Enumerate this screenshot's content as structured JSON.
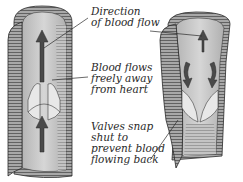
{
  "diagram": {
    "labels": {
      "direction": [
        "Direction",
        "of blood flow"
      ],
      "flows": [
        "Blood flows",
        "freely away",
        "from heart"
      ],
      "valves": [
        "Valves snap",
        "shut to",
        "prevent blood",
        "flowing back"
      ]
    },
    "panels": [
      {
        "name": "open-valve-vein",
        "state": "open",
        "arrow": "up"
      },
      {
        "name": "closed-valve-vein",
        "state": "closed",
        "arrow": "down-backflow"
      }
    ],
    "colors": {
      "ink": "#2a2a2a",
      "wall_dark": "#6e6e6e",
      "wall_mid": "#9a9a9a",
      "lumen": "#c8c8c8",
      "valve": "#e6e6e6",
      "arrow": "#4a4a4a"
    }
  }
}
